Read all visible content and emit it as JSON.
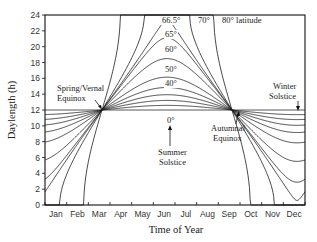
{
  "chart_data": {
    "type": "line",
    "title": "",
    "xlabel": "Time of Year",
    "ylabel": "Daylength (h)",
    "ylim": [
      0,
      24
    ],
    "yticks": [
      0,
      2,
      4,
      6,
      8,
      10,
      12,
      14,
      16,
      18,
      20,
      22,
      24
    ],
    "categories": [
      "Jan",
      "Feb",
      "Mar",
      "Apr",
      "May",
      "Jun",
      "Jul",
      "Aug",
      "Sep",
      "Oct",
      "Nov",
      "Dec"
    ],
    "grid": false,
    "legend": "inline labels at curve peaks",
    "series": [
      {
        "name": "0°",
        "latitude": 0,
        "values": [
          12.0,
          12.0,
          12.0,
          12.0,
          12.0,
          12.0,
          12.0,
          12.0,
          12.0,
          12.0,
          12.0,
          12.0
        ]
      },
      {
        "name": "10°",
        "latitude": 10,
        "values": [
          11.4,
          11.6,
          11.9,
          12.2,
          12.5,
          12.6,
          12.6,
          12.3,
          12.1,
          11.8,
          11.5,
          11.4
        ]
      },
      {
        "name": "20°",
        "latitude": 20,
        "values": [
          10.9,
          11.3,
          11.9,
          12.5,
          13.0,
          13.3,
          13.2,
          12.8,
          12.2,
          11.6,
          11.1,
          10.8
        ]
      },
      {
        "name": "30°",
        "latitude": 30,
        "values": [
          10.3,
          10.9,
          11.8,
          12.8,
          13.6,
          14.1,
          14.0,
          13.3,
          12.3,
          11.4,
          10.6,
          10.1
        ]
      },
      {
        "name": "40°",
        "latitude": 40,
        "values": [
          9.6,
          10.5,
          11.7,
          13.1,
          14.3,
          15.0,
          14.9,
          13.9,
          12.5,
          11.1,
          9.9,
          9.3
        ]
      },
      {
        "name": "50°",
        "latitude": 50,
        "values": [
          8.5,
          9.8,
          11.6,
          13.6,
          15.4,
          16.4,
          16.2,
          14.7,
          12.7,
          10.7,
          8.9,
          8.0
        ]
      },
      {
        "name": "60°",
        "latitude": 60,
        "values": [
          6.5,
          8.8,
          11.4,
          14.3,
          17.1,
          18.8,
          18.4,
          16.0,
          13.0,
          10.1,
          7.3,
          5.6
        ]
      },
      {
        "name": "65°",
        "latitude": 65,
        "values": [
          4.4,
          7.8,
          11.3,
          15.0,
          18.8,
          21.6,
          20.8,
          17.1,
          13.3,
          9.5,
          5.6,
          2.5
        ]
      },
      {
        "name": "66.5°",
        "latitude": 66.5,
        "values": [
          3.4,
          7.4,
          11.2,
          15.3,
          19.6,
          24.0,
          22.4,
          17.6,
          13.4,
          9.3,
          4.8,
          0.0
        ]
      },
      {
        "name": "70°",
        "latitude": 70,
        "values": [
          0.0,
          6.0,
          11.0,
          16.2,
          22.2,
          24.0,
          24.0,
          19.0,
          13.8,
          8.6,
          1.4,
          0.0
        ]
      },
      {
        "name": "80°",
        "latitude": 80,
        "values": [
          0.0,
          0.0,
          9.7,
          21.4,
          24.0,
          24.0,
          24.0,
          24.0,
          15.9,
          4.8,
          0.0,
          0.0
        ]
      }
    ],
    "annotations": [
      {
        "text": "Spring/Vernal Equinox",
        "x": "Mar 21",
        "y": 12
      },
      {
        "text": "Summer Solstice",
        "x": "Jun 21",
        "y": 12
      },
      {
        "text": "Autumnal Equinox",
        "x": "Sep 22",
        "y": 12
      },
      {
        "text": "Winter Solstice",
        "x": "Dec 21",
        "y": 12
      }
    ]
  },
  "labels": {
    "lat_665": "66.5°",
    "lat_70": "70°",
    "lat_80": "80° latitude",
    "lat_65": "65°",
    "lat_60": "60°",
    "lat_50": "50°",
    "lat_40": "40°",
    "lat_0": "0°",
    "spring_1": "Spring/Vernal",
    "spring_2": "Equinox",
    "summer_1": "Summer",
    "summer_2": "Solstice",
    "autumn_1": "Autumnal",
    "autumn_2": "Equinox",
    "winter_1": "Winter",
    "winter_2": "Solstice"
  }
}
